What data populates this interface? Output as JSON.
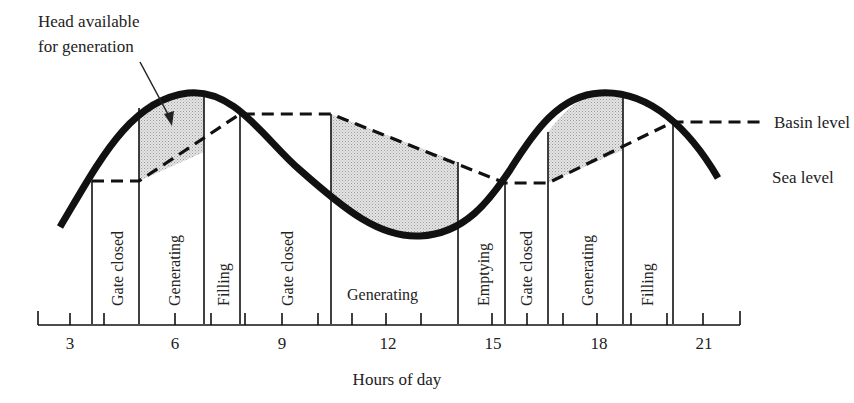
{
  "annotation": {
    "line1": "Head available",
    "line2": "for generation"
  },
  "legend": {
    "basin": "Basin level",
    "sea": "Sea level"
  },
  "axis": {
    "title": "Hours of day",
    "tick_labels": [
      "3",
      "6",
      "9",
      "12",
      "15",
      "18",
      "21"
    ]
  },
  "phases": [
    {
      "label": "Gate closed",
      "orientation": "vertical"
    },
    {
      "label": "Generating",
      "orientation": "vertical"
    },
    {
      "label": "Filling",
      "orientation": "vertical"
    },
    {
      "label": "Gate closed",
      "orientation": "vertical"
    },
    {
      "label": "Generating",
      "orientation": "horizontal"
    },
    {
      "label": "Emptying",
      "orientation": "vertical"
    },
    {
      "label": "Gate closed",
      "orientation": "vertical"
    },
    {
      "label": "Generating",
      "orientation": "vertical"
    },
    {
      "label": "Filling",
      "orientation": "vertical"
    }
  ],
  "colors": {
    "ink": "#111111",
    "shade": "#d6d6d6"
  }
}
